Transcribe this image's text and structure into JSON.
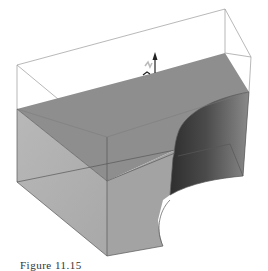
{
  "figure": {
    "caption": "Figure 11.15"
  },
  "colors": {
    "background": "#ffffff",
    "top_face": "#8c8c8c",
    "left_face": "#b4b4b4",
    "front_face": "#a2a2a2",
    "right_face": "#9a9a9a",
    "cylinder_dark": "#3c3c3c",
    "cylinder_mid": "#6e6e6e",
    "edge": "#555555",
    "bbox_edge": "#9a9a9a"
  }
}
